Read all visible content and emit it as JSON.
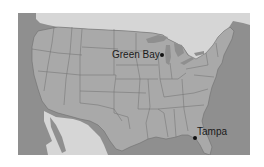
{
  "map": {
    "region": "Contiguous United States",
    "colors": {
      "ocean": "#8f8f8f",
      "us_land": "#a9a9a9",
      "foreign_land": "#d4d4d4",
      "borders": "#6e6e6e",
      "lakes": "#8f8f8f"
    },
    "markers": [
      {
        "name": "Green Bay",
        "label": "Green Bay"
      },
      {
        "name": "Tampa",
        "label": "Tampa"
      }
    ]
  }
}
